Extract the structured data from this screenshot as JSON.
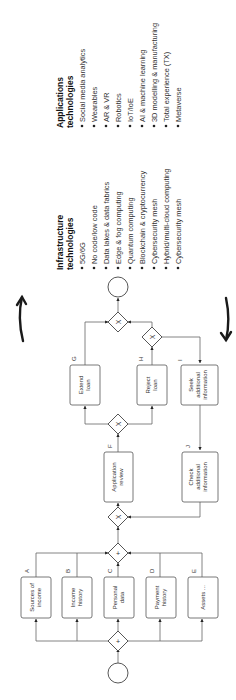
{
  "diagram": {
    "orientation": "rotated 90 degrees counter-clockwise",
    "process": {
      "tasks": [
        {
          "id": "A",
          "lines": [
            "Sources of",
            "income"
          ]
        },
        {
          "id": "B",
          "lines": [
            "Income",
            "history"
          ]
        },
        {
          "id": "C",
          "lines": [
            "Personal",
            "data"
          ]
        },
        {
          "id": "D",
          "lines": [
            "Payment",
            "history"
          ]
        },
        {
          "id": "E",
          "lines": [
            "Assets ..."
          ]
        },
        {
          "id": "F",
          "lines": [
            "Application",
            "review"
          ]
        },
        {
          "id": "G",
          "lines": [
            "Extend",
            "loan"
          ]
        },
        {
          "id": "H",
          "lines": [
            "Reject",
            "loan"
          ]
        },
        {
          "id": "I",
          "lines": [
            "Seek",
            "additional",
            "information"
          ]
        },
        {
          "id": "J",
          "lines": [
            "Check",
            "additional",
            "information"
          ]
        }
      ],
      "gateway_symbols": {
        "parallel": "+",
        "exclusive": "X"
      }
    },
    "infrastructure": {
      "title_line1": "Infrastructure",
      "title_line2": "technologies",
      "items": [
        "5G/6G",
        "No code/low code",
        "Data lakes & data fabrics",
        "Edge & fog computing",
        "Quantum computing",
        "Blockchain & cryptocurrency",
        "Cybersecurity mesh",
        "Hybrid/multi-cloud computing",
        "Cybersecurity mesh"
      ]
    },
    "applications": {
      "title_line1": "Applications",
      "title_line2": "technologies",
      "items": [
        "Social media analytics",
        "Wearables",
        "AR & VR",
        "Robotics",
        "IoT/IoE",
        "AI & machine learning",
        "3D modelling & manufacturing",
        "Total experience (TX)",
        "Metaverse"
      ]
    }
  }
}
